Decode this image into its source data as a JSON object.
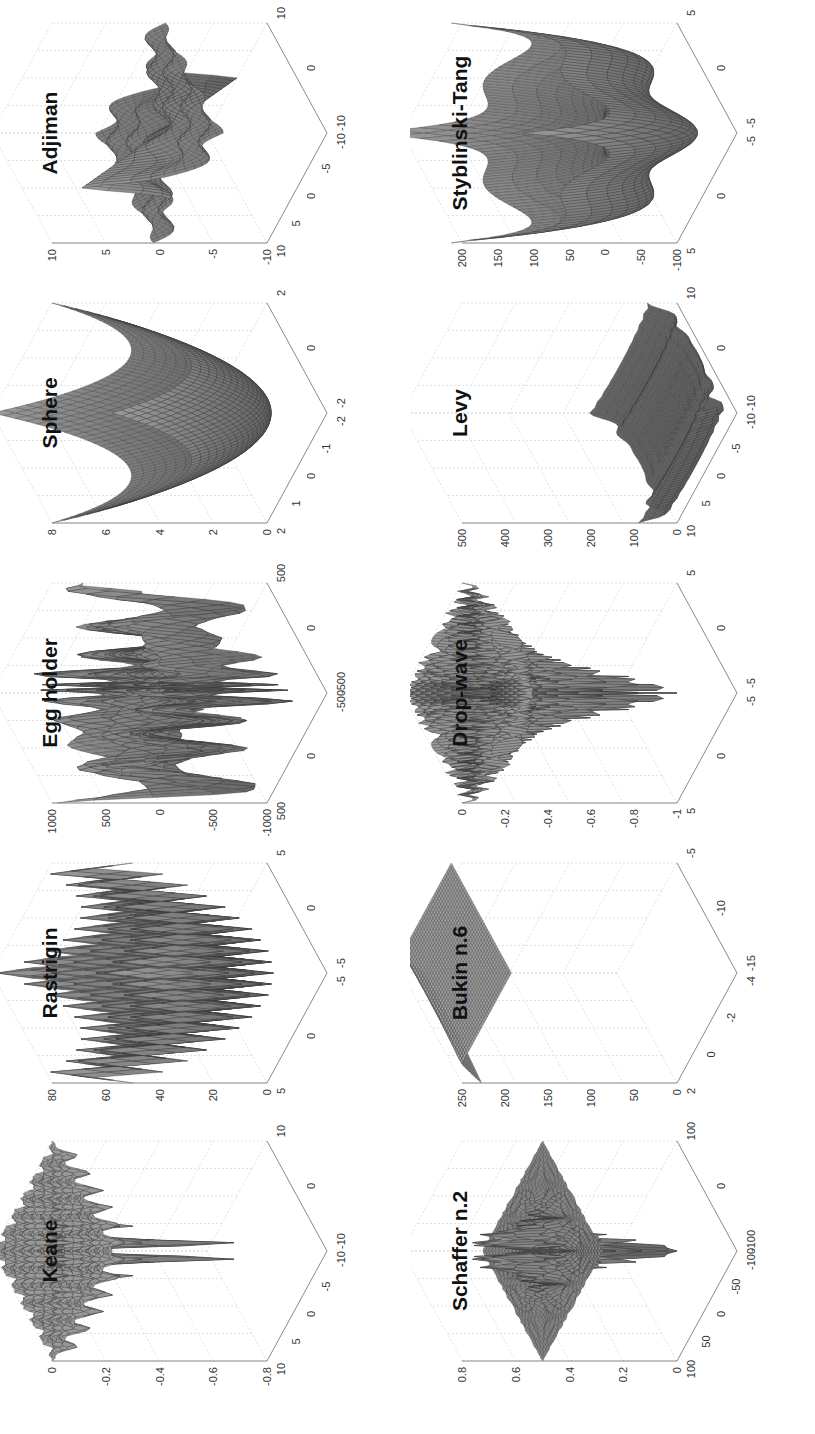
{
  "figure": {
    "orientation": "rotated 90 degrees counter-clockwise",
    "layout": {
      "rows": 2,
      "cols": 5
    },
    "surface_color": "#808080",
    "edge_color": "#3a3a3a",
    "axis_color": "#8a8a8a",
    "grid_color": "#d9d9d9"
  },
  "chart_data": [
    {
      "type": "surface3d",
      "title": "Keane",
      "row": 0,
      "col": 0,
      "fn": "keane",
      "x_ticks": [
        "10",
        "5",
        "0",
        "-5",
        "-10"
      ],
      "y_ticks": [
        "-10",
        "0",
        "10"
      ],
      "z_ticks": [
        "0",
        "-0.2",
        "-0.4",
        "-0.6",
        "-0.8"
      ],
      "xlim": [
        -10,
        10
      ],
      "ylim": [
        -10,
        10
      ],
      "zlim": [
        -0.8,
        0
      ],
      "grid": true
    },
    {
      "type": "surface3d",
      "title": "Rastrigin",
      "row": 0,
      "col": 1,
      "fn": "rastrigin",
      "x_ticks": [
        "5",
        "0",
        "-5"
      ],
      "y_ticks": [
        "-5",
        "0",
        "5"
      ],
      "z_ticks": [
        "80",
        "60",
        "40",
        "20",
        "0"
      ],
      "xlim": [
        -5,
        5
      ],
      "ylim": [
        -5,
        5
      ],
      "zlim": [
        0,
        80
      ],
      "grid": true
    },
    {
      "type": "surface3d",
      "title": "Egg holder",
      "row": 0,
      "col": 2,
      "fn": "eggholder",
      "x_ticks": [
        "500",
        "0",
        "-500"
      ],
      "y_ticks": [
        "-500",
        "0",
        "500"
      ],
      "z_ticks": [
        "1000",
        "500",
        "0",
        "-500",
        "-1000"
      ],
      "xlim": [
        -500,
        500
      ],
      "ylim": [
        -500,
        500
      ],
      "zlim": [
        -1000,
        1000
      ],
      "grid": true
    },
    {
      "type": "surface3d",
      "title": "Sphere",
      "row": 0,
      "col": 3,
      "fn": "sphere",
      "x_ticks": [
        "2",
        "1",
        "0",
        "-1",
        "-2"
      ],
      "y_ticks": [
        "-2",
        "0",
        "2"
      ],
      "z_ticks": [
        "8",
        "6",
        "4",
        "2",
        "0"
      ],
      "xlim": [
        -2,
        2
      ],
      "ylim": [
        -2,
        2
      ],
      "zlim": [
        0,
        8
      ],
      "grid": true
    },
    {
      "type": "surface3d",
      "title": "Adjiman",
      "row": 0,
      "col": 4,
      "fn": "adjiman",
      "x_ticks": [
        "10",
        "5",
        "0",
        "-5",
        "-10"
      ],
      "y_ticks": [
        "-10",
        "0",
        "10"
      ],
      "z_ticks": [
        "10",
        "5",
        "0",
        "-5",
        "-10"
      ],
      "xlim": [
        -10,
        10
      ],
      "ylim": [
        -10,
        10
      ],
      "zlim": [
        -10,
        10
      ],
      "grid": true
    },
    {
      "type": "surface3d",
      "title": "Schaffer n.2",
      "row": 1,
      "col": 0,
      "fn": "schaffer2",
      "x_ticks": [
        "100",
        "50",
        "0",
        "-50",
        "-100"
      ],
      "y_ticks": [
        "-100",
        "0",
        "100"
      ],
      "z_ticks": [
        "0.8",
        "0.6",
        "0.4",
        "0.2",
        "0"
      ],
      "xlim": [
        -100,
        100
      ],
      "ylim": [
        -100,
        100
      ],
      "zlim": [
        0,
        0.8
      ],
      "grid": true
    },
    {
      "type": "surface3d",
      "title": "Bukin n.6",
      "row": 1,
      "col": 1,
      "fn": "bukin6",
      "x_ticks": [
        "2",
        "0",
        "-2",
        "-4"
      ],
      "y_ticks": [
        "-15",
        "-10",
        "-5"
      ],
      "z_ticks": [
        "250",
        "200",
        "150",
        "100",
        "50",
        "0"
      ],
      "xlim": [
        -4,
        2
      ],
      "ylim": [
        -15,
        -5
      ],
      "zlim": [
        0,
        250
      ],
      "grid": true
    },
    {
      "type": "surface3d",
      "title": "Drop-wave",
      "row": 1,
      "col": 2,
      "fn": "dropwave",
      "x_ticks": [
        "5",
        "0",
        "-5"
      ],
      "y_ticks": [
        "-5",
        "0",
        "5"
      ],
      "z_ticks": [
        "0",
        "-0.2",
        "-0.4",
        "-0.6",
        "-0.8",
        "-1"
      ],
      "xlim": [
        -5,
        5
      ],
      "ylim": [
        -5,
        5
      ],
      "zlim": [
        -1,
        0
      ],
      "grid": true
    },
    {
      "type": "surface3d",
      "title": "Levy",
      "row": 1,
      "col": 3,
      "fn": "levy",
      "x_ticks": [
        "10",
        "5",
        "0",
        "-5",
        "-10"
      ],
      "y_ticks": [
        "-10",
        "0",
        "10"
      ],
      "z_ticks": [
        "500",
        "400",
        "300",
        "200",
        "100",
        "0"
      ],
      "xlim": [
        -10,
        10
      ],
      "ylim": [
        -10,
        10
      ],
      "zlim": [
        0,
        500
      ],
      "grid": true
    },
    {
      "type": "surface3d",
      "title": "Styblinski-Tang",
      "row": 1,
      "col": 4,
      "fn": "styblinski",
      "x_ticks": [
        "5",
        "0",
        "-5"
      ],
      "y_ticks": [
        "-5",
        "0",
        "5"
      ],
      "z_ticks": [
        "200",
        "150",
        "100",
        "50",
        "0",
        "-50",
        "-100"
      ],
      "xlim": [
        -5,
        5
      ],
      "ylim": [
        -5,
        5
      ],
      "zlim": [
        -100,
        200
      ],
      "grid": true
    }
  ]
}
